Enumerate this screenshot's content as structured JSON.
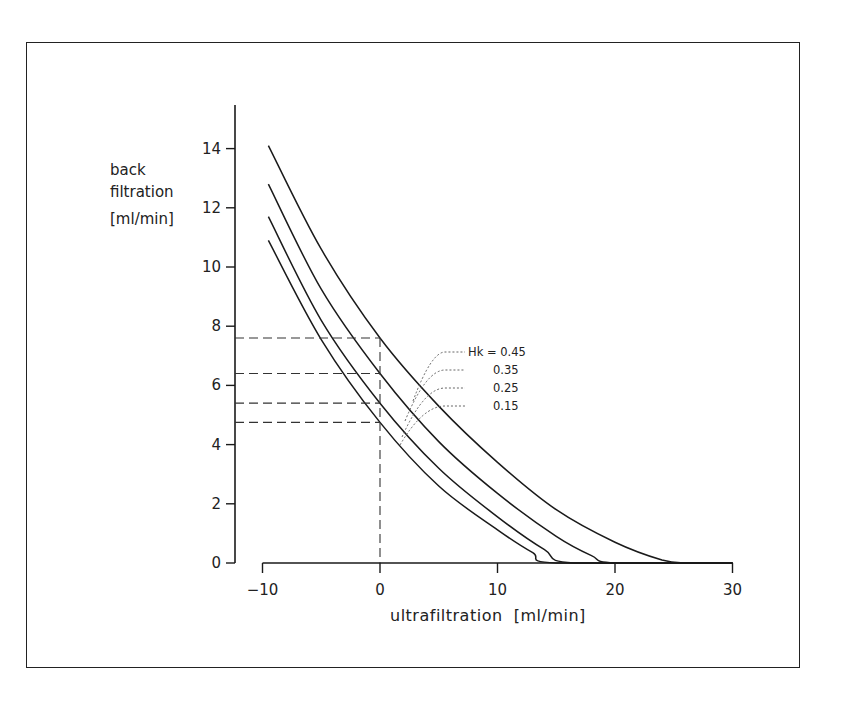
{
  "chart_data": {
    "type": "line",
    "title": "",
    "xlabel": "ultrafiltration  [ml/min]",
    "ylabel": [
      "back",
      "filtration",
      "[ml/min]"
    ],
    "xlim": [
      -10,
      30
    ],
    "ylim": [
      0,
      15
    ],
    "xticks": [
      -10,
      0,
      10,
      20,
      30
    ],
    "xtick_labels": [
      "−10",
      "0",
      "10",
      "20",
      "30"
    ],
    "yticks": [
      0,
      2,
      4,
      6,
      8,
      10,
      12,
      14
    ],
    "ytick_labels": [
      "0",
      "2",
      "4",
      "6",
      "8",
      "10",
      "12",
      "14"
    ],
    "grid": false,
    "legend_position": "inline annotations (right of curves)",
    "legend_title": "Hk =",
    "series": [
      {
        "name": "Hk = 0.45",
        "label": "Hk = 0.45",
        "x": [
          -9.5,
          -5,
          0,
          5,
          10,
          15,
          20,
          24,
          26,
          30
        ],
        "y": [
          14.1,
          10.6,
          7.6,
          5.3,
          3.4,
          1.8,
          0.7,
          0.1,
          0,
          0
        ]
      },
      {
        "name": "Hk = 0.35",
        "label": "0.35",
        "x": [
          -9.5,
          -5,
          0,
          5,
          10,
          15,
          18,
          20,
          30
        ],
        "y": [
          12.8,
          9.25,
          6.4,
          4.1,
          2.35,
          0.9,
          0.25,
          0,
          0
        ]
      },
      {
        "name": "Hk = 0.25",
        "label": "0.25",
        "x": [
          -9.5,
          -5,
          0,
          5,
          10,
          14,
          16.5,
          30
        ],
        "y": [
          11.7,
          8.2,
          5.4,
          3.2,
          1.56,
          0.45,
          0,
          0
        ]
      },
      {
        "name": "Hk = 0.15",
        "label": "0.15",
        "x": [
          -9.5,
          -5,
          0,
          5,
          10,
          13,
          15,
          30
        ],
        "y": [
          10.9,
          7.55,
          4.75,
          2.6,
          1.12,
          0.35,
          0,
          0
        ]
      }
    ],
    "annotations": {
      "reference_x": 0,
      "reference_y_values": [
        7.6,
        6.4,
        5.4,
        4.75
      ],
      "style": "dashed lines from curves at x=0 to y-axis"
    }
  }
}
